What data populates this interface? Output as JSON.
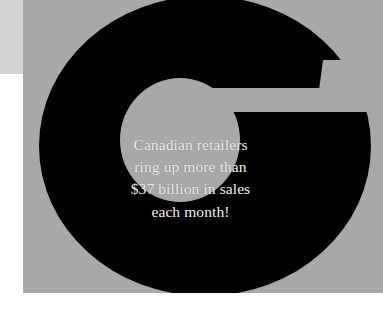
{
  "poster": {
    "background_color": "#ffffff",
    "panel_color": "#a8a8a8",
    "corner_strip_color": "#d3d3d3",
    "letterform_color": "#000000",
    "text_color": "#f2f0ec",
    "drop_cap_letter": "G",
    "alt_text": "Large black letter G on a gray panel with a white serif statistic overlaid"
  },
  "quote": {
    "lines": [
      "Canadian retailers",
      "ring up more than",
      "$37 billion in sales",
      "each month!"
    ],
    "full_text": "Canadian retailers ring up more than $37 billion in sales each month!",
    "amount": "$37 billion",
    "period": "each month"
  }
}
